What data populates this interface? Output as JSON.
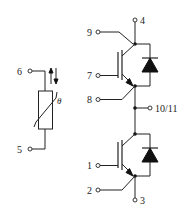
{
  "diagram": {
    "type": "circuit-schematic",
    "thermistor": {
      "pins": [
        {
          "id": "pin-6",
          "label": "6"
        },
        {
          "id": "pin-5",
          "label": "5"
        }
      ],
      "symbol_label": "θ"
    },
    "upper_switch": {
      "pins": [
        {
          "id": "pin-4",
          "label": "4",
          "role": "collector"
        },
        {
          "id": "pin-9",
          "label": "9",
          "role": "collector-sense"
        },
        {
          "id": "pin-7",
          "label": "7",
          "role": "gate"
        },
        {
          "id": "pin-8",
          "label": "8",
          "role": "emitter-sense"
        }
      ]
    },
    "midpoint": {
      "id": "pin-10-11",
      "label": "10/11"
    },
    "lower_switch": {
      "pins": [
        {
          "id": "pin-1",
          "label": "1",
          "role": "gate"
        },
        {
          "id": "pin-2",
          "label": "2",
          "role": "emitter-sense"
        },
        {
          "id": "pin-3",
          "label": "3",
          "role": "emitter"
        }
      ]
    },
    "colors": {
      "line": "#222222",
      "background": "#ffffff"
    }
  }
}
